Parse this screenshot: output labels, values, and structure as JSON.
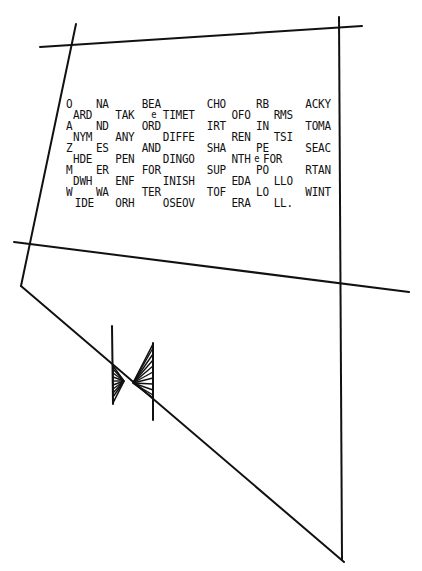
{
  "drawing": {
    "stroke_color": "#111111",
    "background": "#ffffff",
    "lines": [
      {
        "name": "top-line",
        "x1": 40,
        "y1": 47,
        "x2": 362,
        "y2": 26
      },
      {
        "name": "left-slant-line",
        "x1": 76,
        "y1": 24,
        "x2": 21,
        "y2": 286
      },
      {
        "name": "right-vertical-line",
        "x1": 339,
        "y1": 17,
        "x2": 342,
        "y2": 560
      },
      {
        "name": "middle-line",
        "x1": 14,
        "y1": 242,
        "x2": 409,
        "y2": 292
      },
      {
        "name": "diagonal-line",
        "x1": 21,
        "y1": 286,
        "x2": 344,
        "y2": 562
      },
      {
        "name": "left-tick",
        "x1": 112,
        "y1": 326,
        "x2": 113,
        "y2": 404
      },
      {
        "name": "right-tick",
        "x1": 153,
        "y1": 343,
        "x2": 153,
        "y2": 420
      }
    ]
  },
  "text_rows": [
    {
      "y": 0,
      "words": [
        {
          "x": 0,
          "t": "O"
        },
        {
          "x": 34,
          "t": "NA"
        },
        {
          "x": 82,
          "t": "BEA"
        },
        {
          "x": 148,
          "t": "CHO"
        },
        {
          "x": 200,
          "t": "RB"
        },
        {
          "x": 250,
          "t": "ACKY"
        }
      ]
    },
    {
      "y": 10,
      "words": [
        {
          "x": 8,
          "t": "ARD"
        },
        {
          "x": 55,
          "t": "TAK"
        },
        {
          "x": 96,
          "t": "e"
        },
        {
          "x": 108,
          "t": "TIMET"
        },
        {
          "x": 174,
          "t": "OFO"
        },
        {
          "x": 220,
          "t": "RMS"
        }
      ]
    },
    {
      "y": 22,
      "words": [
        {
          "x": 0,
          "t": "A"
        },
        {
          "x": 34,
          "t": "ND"
        },
        {
          "x": 82,
          "t": "ORD"
        },
        {
          "x": 148,
          "t": "IRT"
        },
        {
          "x": 200,
          "t": "IN"
        },
        {
          "x": 250,
          "t": "TOMA"
        }
      ]
    },
    {
      "y": 32,
      "words": [
        {
          "x": 8,
          "t": "NYM"
        },
        {
          "x": 55,
          "t": "ANY"
        },
        {
          "x": 108,
          "t": "DIFFE"
        },
        {
          "x": 174,
          "t": "REN"
        },
        {
          "x": 220,
          "t": "TSI"
        }
      ]
    },
    {
      "y": 44,
      "words": [
        {
          "x": 0,
          "t": "Z"
        },
        {
          "x": 34,
          "t": "ES"
        },
        {
          "x": 82,
          "t": "AND"
        },
        {
          "x": 148,
          "t": "SHA"
        },
        {
          "x": 200,
          "t": "PE"
        },
        {
          "x": 250,
          "t": "SEAC"
        }
      ]
    },
    {
      "y": 54,
      "words": [
        {
          "x": 8,
          "t": "HDE"
        },
        {
          "x": 55,
          "t": "PEN"
        },
        {
          "x": 108,
          "t": "DINGO"
        },
        {
          "x": 174,
          "t": "NTH"
        },
        {
          "x": 200,
          "t": "e"
        },
        {
          "x": 210,
          "t": "FOR"
        }
      ]
    },
    {
      "y": 66,
      "words": [
        {
          "x": 0,
          "t": "M"
        },
        {
          "x": 34,
          "t": "ER"
        },
        {
          "x": 82,
          "t": "FOR"
        },
        {
          "x": 148,
          "t": "SUP"
        },
        {
          "x": 200,
          "t": "PO"
        },
        {
          "x": 250,
          "t": "RTAN"
        }
      ]
    },
    {
      "y": 76,
      "words": [
        {
          "x": 8,
          "t": "DWH"
        },
        {
          "x": 55,
          "t": "ENF"
        },
        {
          "x": 108,
          "t": "INISH"
        },
        {
          "x": 174,
          "t": "EDA"
        },
        {
          "x": 220,
          "t": "LLO"
        }
      ]
    },
    {
      "y": 88,
      "words": [
        {
          "x": 0,
          "t": "W"
        },
        {
          "x": 34,
          "t": "WA"
        },
        {
          "x": 82,
          "t": "TER"
        },
        {
          "x": 148,
          "t": "TOF"
        },
        {
          "x": 200,
          "t": "LO"
        },
        {
          "x": 250,
          "t": "WINT"
        }
      ]
    },
    {
      "y": 98,
      "words": [
        {
          "x": 8,
          "t": "IDE"
        },
        {
          "x": 55,
          "t": "ORH"
        },
        {
          "x": 108,
          "t": "OSEOV"
        },
        {
          "x": 174,
          "t": "ERA"
        },
        {
          "x": 220,
          "t": "LL."
        }
      ]
    }
  ],
  "labels": {
    "r0w0": "O",
    "r0w1": "NA",
    "r0w2": "BEA",
    "r0w3": "CHO",
    "r0w4": "RB",
    "r0w5": "ACKY",
    "r1w0": "ARD",
    "r1w1": "TAK",
    "r1w2": "e",
    "r1w3": "TIMET",
    "r1w4": "OFO",
    "r1w5": "RMS",
    "r2w0": "A",
    "r2w1": "ND",
    "r2w2": "ORD",
    "r2w3": "IRT",
    "r2w4": "IN",
    "r2w5": "TOMA",
    "r3w0": "NYM",
    "r3w1": "ANY",
    "r3w2": "DIFFE",
    "r3w3": "REN",
    "r3w4": "TSI",
    "r4w0": "Z",
    "r4w1": "ES",
    "r4w2": "AND",
    "r4w3": "SHA",
    "r4w4": "PE",
    "r4w5": "SEAC",
    "r5w0": "HDE",
    "r5w1": "PEN",
    "r5w2": "DINGO",
    "r5w3": "NTH",
    "r5w4": "e",
    "r5w5": "FOR",
    "r6w0": "M",
    "r6w1": "ER",
    "r6w2": "FOR",
    "r6w3": "SUP",
    "r6w4": "PO",
    "r6w5": "RTAN",
    "r7w0": "DWH",
    "r7w1": "ENF",
    "r7w2": "INISH",
    "r7w3": "EDA",
    "r7w4": "LLO",
    "r8w0": "W",
    "r8w1": "WA",
    "r8w2": "TER",
    "r8w3": "TOF",
    "r8w4": "LO",
    "r8w5": "WINT",
    "r9w0": "IDE",
    "r9w1": "ORH",
    "r9w2": "OSEOV",
    "r9w3": "ERA",
    "r9w4": "LL."
  }
}
